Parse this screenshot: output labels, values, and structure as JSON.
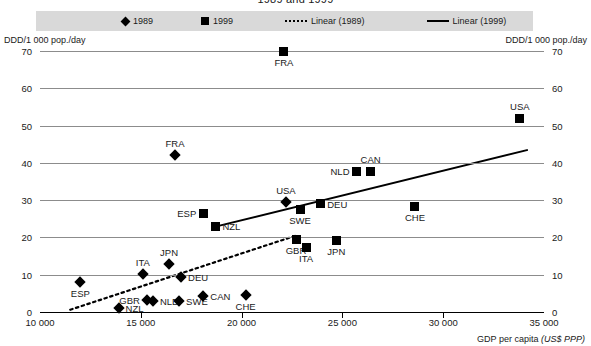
{
  "title": "1989 and 1999",
  "legend": {
    "items": [
      {
        "id": "1989",
        "label": "1989",
        "symbol": "diamond-marker"
      },
      {
        "id": "1999",
        "label": "1999",
        "symbol": "square-marker"
      },
      {
        "id": "linear-1989",
        "label": "Linear (1989)",
        "symbol": "dashed-line"
      },
      {
        "id": "linear-1999",
        "label": "Linear (1999)",
        "symbol": "solid-line"
      }
    ]
  },
  "chart_data": {
    "type": "scatter",
    "title": "1989 and 1999",
    "xlabel": "GDP per capita (US$ PPP)",
    "ylabel": "DDD/1 000 pop./day",
    "ylabel_right": "DDD/1 000 pop./day",
    "xlim": [
      10000,
      35000
    ],
    "ylim": [
      0,
      70
    ],
    "xticks": [
      10000,
      15000,
      20000,
      25000,
      30000,
      35000
    ],
    "xtick_labels": [
      "10 000",
      "15 000",
      "20 000",
      "25 000",
      "30 000",
      "35 000"
    ],
    "yticks": [
      0,
      10,
      20,
      30,
      40,
      50,
      60,
      70
    ],
    "ytick_labels": [
      "0",
      "10",
      "20",
      "30",
      "40",
      "50",
      "60",
      "70"
    ],
    "grid": true,
    "legend_position": "top",
    "series": [
      {
        "name": "1989",
        "marker": "diamond",
        "points": [
          {
            "label": "ESP",
            "x": 12000,
            "y": 8.0,
            "label_pos": "below"
          },
          {
            "label": "NZL",
            "x": 13900,
            "y": 1.0,
            "label_pos": "right"
          },
          {
            "label": "ITA",
            "x": 15100,
            "y": 10.2,
            "label_pos": "above"
          },
          {
            "label": "GBR",
            "x": 15300,
            "y": 3.2,
            "label_pos": "left"
          },
          {
            "label": "NLD",
            "x": 15600,
            "y": 3.0,
            "label_pos": "right"
          },
          {
            "label": "JPN",
            "x": 16400,
            "y": 13.0,
            "label_pos": "above"
          },
          {
            "label": "SWE",
            "x": 16900,
            "y": 2.9,
            "label_pos": "right"
          },
          {
            "label": "DEU",
            "x": 17000,
            "y": 9.3,
            "label_pos": "right"
          },
          {
            "label": "CAN",
            "x": 18100,
            "y": 4.3,
            "label_pos": "right"
          },
          {
            "label": "CHE",
            "x": 20200,
            "y": 4.5,
            "label_pos": "below"
          },
          {
            "label": "USA",
            "x": 22200,
            "y": 29.5,
            "label_pos": "above"
          },
          {
            "label": "FRA",
            "x": 16700,
            "y": 42.0,
            "label_pos": "above"
          }
        ]
      },
      {
        "name": "1999",
        "marker": "square",
        "points": [
          {
            "label": "ESP",
            "x": 18100,
            "y": 26.5,
            "label_pos": "left"
          },
          {
            "label": "NZL",
            "x": 18700,
            "y": 23.0,
            "label_pos": "right"
          },
          {
            "label": "GBR",
            "x": 22700,
            "y": 19.5,
            "label_pos": "below"
          },
          {
            "label": "ITA",
            "x": 23200,
            "y": 17.3,
            "label_pos": "below"
          },
          {
            "label": "SWE",
            "x": 22900,
            "y": 27.5,
            "label_pos": "below"
          },
          {
            "label": "DEU",
            "x": 23900,
            "y": 29.0,
            "label_pos": "right"
          },
          {
            "label": "JPN",
            "x": 24700,
            "y": 19.2,
            "label_pos": "below"
          },
          {
            "label": "NLD",
            "x": 25700,
            "y": 37.8,
            "label_pos": "left"
          },
          {
            "label": "CAN",
            "x": 26400,
            "y": 37.8,
            "label_pos": "above"
          },
          {
            "label": "CHE",
            "x": 28600,
            "y": 28.4,
            "label_pos": "below"
          },
          {
            "label": "USA",
            "x": 33800,
            "y": 52.0,
            "label_pos": "above"
          },
          {
            "label": "FRA",
            "x": 22100,
            "y": 70.0,
            "label_pos": "below"
          }
        ]
      }
    ],
    "trendlines": [
      {
        "name": "Linear (1989)",
        "style": "dashed",
        "x1": 11500,
        "y1": 0.6,
        "x2": 22700,
        "y2": 20.5
      },
      {
        "name": "Linear (1999)",
        "style": "solid",
        "x1": 18500,
        "y1": 22.6,
        "x2": 34200,
        "y2": 43.5
      }
    ]
  }
}
